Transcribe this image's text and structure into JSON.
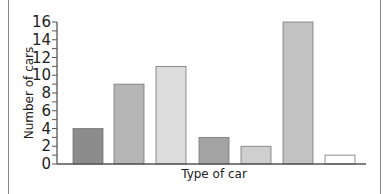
{
  "chart_data": {
    "type": "bar",
    "title": "",
    "xlabel": "Type of car",
    "ylabel": "Number of cars",
    "categories": [
      "Car 1",
      "Car 2",
      "Car 3",
      "Car 4",
      "Car 5",
      "Car 6",
      "Car 7"
    ],
    "category_labels_visible": false,
    "values": [
      4,
      9,
      11,
      3,
      2,
      16,
      1
    ],
    "bar_colors": [
      "#8c8c8c",
      "#b5b5b5",
      "#dcdcdc",
      "#a3a3a3",
      "#cfcfcf",
      "#c2c2c2",
      "#ffffff"
    ],
    "ylim": [
      0,
      16
    ],
    "yticks_major": [
      0,
      2,
      4,
      6,
      8,
      10,
      12,
      14,
      16
    ],
    "ytick_labels": [
      "0",
      "2",
      "4",
      "6",
      "8",
      "10",
      "12",
      "14",
      "16"
    ],
    "yticks_minor_step": 1,
    "grid": false,
    "legend": null
  }
}
